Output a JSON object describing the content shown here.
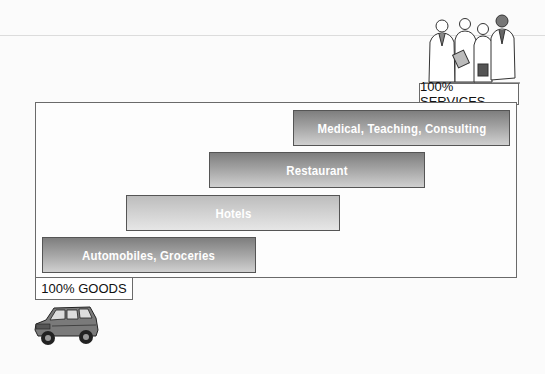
{
  "diagram": {
    "top_label": "100% SERVICES",
    "bottom_label": "100% GOODS",
    "bars": [
      {
        "label": "Medical, Teaching, Consulting",
        "shade": "dark"
      },
      {
        "label": "Restaurant",
        "shade": "dark"
      },
      {
        "label": "Hotels",
        "shade": "light"
      },
      {
        "label": "Automobiles, Groceries",
        "shade": "dark"
      }
    ],
    "illustrations": {
      "top": "professionals-group-icon",
      "bottom": "suv-car-icon"
    },
    "colors": {
      "frame": "#6a6a6a",
      "dark_bar_top": "#7e7e7e",
      "dark_bar_bottom": "#d0d0d0",
      "light_bar_top": "#bdbdbd",
      "light_bar_bottom": "#e6e6e6"
    }
  }
}
